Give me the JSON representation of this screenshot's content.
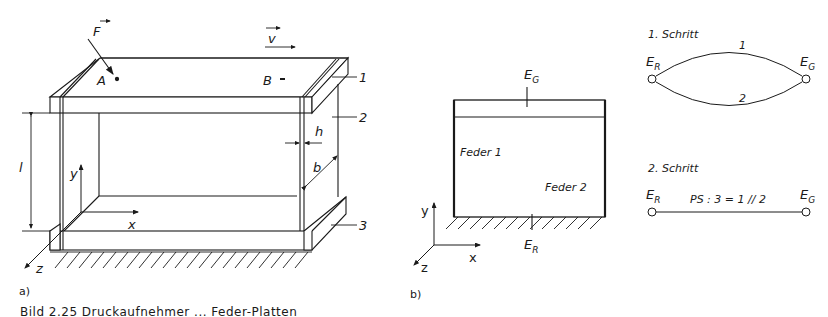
{
  "figure": {
    "panel_a": {
      "tag": "a)",
      "force_label": "F",
      "velocity_label": "v",
      "point_a": "A",
      "point_b": "B",
      "part_labels": [
        "1",
        "2",
        "3"
      ],
      "dim_thickness": "h",
      "dim_width": "b",
      "dim_length": "l",
      "axes": {
        "x": "x",
        "y": "y",
        "z": "z"
      }
    },
    "panel_b": {
      "tag": "b)",
      "top_node": {
        "main": "E",
        "sub": "G"
      },
      "bottom_node": {
        "main": "E",
        "sub": "R"
      },
      "spring_1": "Feder 1",
      "spring_2": "Feder 2",
      "axes": {
        "x": "x",
        "y": "y",
        "z": "z"
      }
    },
    "graph": {
      "step1": {
        "title": "1. Schritt",
        "left_node": {
          "main": "E",
          "sub": "R"
        },
        "right_node": {
          "main": "E",
          "sub": "G"
        },
        "edge_upper": "1",
        "edge_lower": "2"
      },
      "step2": {
        "title": "2. Schritt",
        "left_node": {
          "main": "E",
          "sub": "R"
        },
        "right_node": {
          "main": "E",
          "sub": "G"
        },
        "edge_label": "PS : 3 = 1 // 2"
      }
    },
    "caption": "Bild 2.25  Druckaufnehmer ... Feder-Platten"
  }
}
